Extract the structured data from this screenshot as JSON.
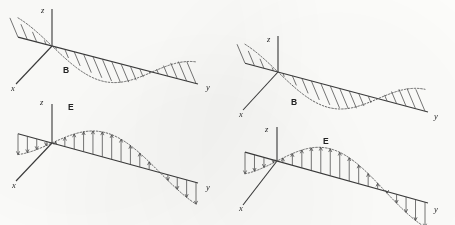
{
  "figure": {
    "background_color": "#fdfdfb",
    "stroke_color": "#3a3a3a",
    "curve_color": "#555555",
    "panel_count": 4
  },
  "panels": [
    {
      "id": "top-left",
      "field_label": "B",
      "field_label_x": 63,
      "field_label_y": 73,
      "axis_labels": {
        "z": "z",
        "x": "x",
        "y": "y"
      },
      "z_label_x": 41,
      "z_label_y": 13,
      "x_label_x": 11,
      "x_label_y": 91,
      "y_label_x": 206,
      "y_label_y": 90,
      "origin_x": 52,
      "origin_y": 46,
      "z_top_y": 9,
      "x_end_x": 16,
      "x_end_y": 84,
      "y_end_x": 198,
      "y_end_y": 84,
      "amplitude": 22,
      "wavelength_px": 100,
      "phase_sign": -1,
      "hatch_style": "oblique",
      "hatch_count": 19,
      "wave_start_x": 18,
      "wave_end_x": 196
    },
    {
      "id": "top-right",
      "field_label": "B",
      "field_label_x": 291,
      "field_label_y": 105,
      "axis_labels": {
        "z": "z",
        "x": "x",
        "y": "y"
      },
      "z_label_x": 267,
      "z_label_y": 42,
      "x_label_x": 239,
      "x_label_y": 117,
      "y_label_x": 434,
      "y_label_y": 119,
      "origin_x": 278,
      "origin_y": 72,
      "z_top_y": 36,
      "x_end_x": 243,
      "x_end_y": 110,
      "y_end_x": 428,
      "y_end_y": 112,
      "amplitude": 22,
      "wavelength_px": 100,
      "phase_sign": -1,
      "hatch_style": "oblique",
      "hatch_count": 19,
      "wave_start_x": 245,
      "wave_end_x": 425
    },
    {
      "id": "bottom-left",
      "field_label": "E",
      "field_label_x": 68,
      "field_label_y": 110,
      "axis_labels": {
        "z": "z",
        "x": "x",
        "y": "y"
      },
      "z_label_x": 40,
      "z_label_y": 105,
      "x_label_x": 12,
      "x_label_y": 188,
      "y_label_x": 206,
      "y_label_y": 190,
      "origin_x": 52,
      "origin_y": 143,
      "z_top_y": 104,
      "x_end_x": 16,
      "x_end_y": 181,
      "y_end_x": 198,
      "y_end_y": 183,
      "amplitude": 25,
      "wavelength_px": 108,
      "phase_sign": 1,
      "hatch_style": "vertical",
      "hatch_count": 19,
      "wave_start_x": 18,
      "wave_end_x": 196
    },
    {
      "id": "bottom-right",
      "field_label": "E",
      "field_label_x": 323,
      "field_label_y": 144,
      "axis_labels": {
        "z": "z",
        "x": "x",
        "y": "y"
      },
      "z_label_x": 265,
      "z_label_y": 132,
      "x_label_x": 239,
      "x_label_y": 211,
      "y_label_x": 434,
      "y_label_y": 212,
      "origin_x": 277,
      "origin_y": 161,
      "z_top_y": 127,
      "x_end_x": 243,
      "x_end_y": 205,
      "y_end_x": 428,
      "y_end_y": 203,
      "amplitude": 27,
      "wavelength_px": 108,
      "phase_sign": 1,
      "hatch_style": "vertical",
      "hatch_count": 19,
      "wave_start_x": 245,
      "wave_end_x": 425
    }
  ]
}
